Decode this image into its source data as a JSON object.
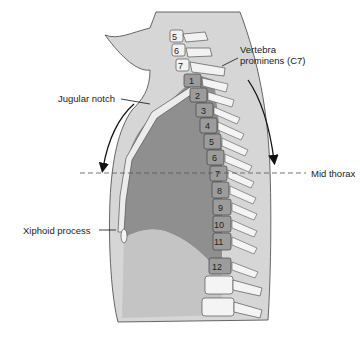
{
  "diagram": {
    "type": "anatomical-sagittal-thorax",
    "labels": {
      "vertebra_prominens": "Vertebra\nprominens (C7)",
      "vertebra_prominens_line1": "Vertebra",
      "vertebra_prominens_line2": "prominens (C7)",
      "jugular_notch": "Jugular notch",
      "mid_thorax": "Mid thorax",
      "xiphoid_process": "Xiphoid process"
    },
    "cervical_vertebrae": [
      "5",
      "6",
      "7"
    ],
    "thoracic_vertebrae": [
      "1",
      "2",
      "3",
      "4",
      "5",
      "6",
      "7",
      "8",
      "9",
      "10",
      "11",
      "12"
    ],
    "colors": {
      "skin": "#d3d3d3",
      "lung": "#8e8e8e",
      "abdomen": "#c2c2c2",
      "vertebra_body": "#9a9a9a",
      "bone": "#f4f4f4",
      "outline": "#333333"
    }
  }
}
